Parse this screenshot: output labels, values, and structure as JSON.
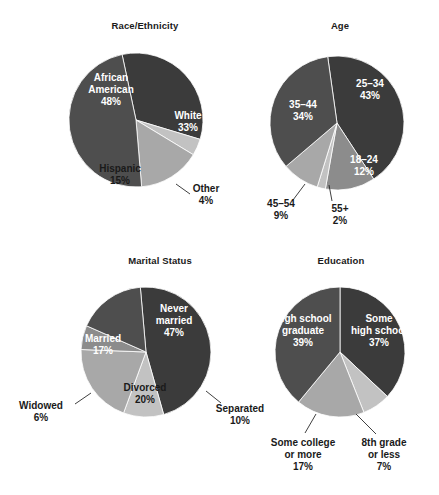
{
  "figure": {
    "background": "#ffffff",
    "width": 439,
    "height": 495
  },
  "palette": {
    "darkest": "#3b3b3b",
    "dark": "#4e4e4e",
    "mid": "#8c8c8c",
    "light": "#a8a8a8",
    "lightest": "#c2c2c2",
    "label_on_dark": "#ffffff",
    "label_on_light": "#1a1a1a",
    "leader_line": "#2a2a2a"
  },
  "charts": [
    {
      "id": "race-ethnicity",
      "title": "Race/Ethnicity",
      "title_pos": {
        "x": 145,
        "y": 29
      },
      "center": {
        "x": 136,
        "y": 120
      },
      "radius": 67,
      "start_angle": -12,
      "slices": [
        {
          "name": "White",
          "value": 33,
          "label": "White",
          "pct": "33%",
          "color": "#3b3b3b",
          "placement": "inside",
          "label_pos": {
            "x": 188,
            "y": 119
          },
          "text_fill": "#ffffff"
        },
        {
          "name": "Other",
          "value": 4,
          "label": "Other",
          "pct": "4%",
          "color": "#c2c2c2",
          "placement": "outside",
          "label_pos": {
            "x": 206,
            "y": 192
          },
          "text_fill": "#1a1a1a",
          "leader": [
            [
              176,
              184
            ],
            [
              190,
              194
            ]
          ]
        },
        {
          "name": "Hispanic",
          "value": 15,
          "label": "Hispanic",
          "pct": "15%",
          "color": "#a8a8a8",
          "placement": "inside",
          "label_pos": {
            "x": 120,
            "y": 172
          },
          "text_fill": "#1a1a1a"
        },
        {
          "name": "African American",
          "value": 48,
          "label": "African American",
          "pct": "48%",
          "color": "#4e4e4e",
          "placement": "inside",
          "label_pos": {
            "x": 111,
            "y": 81
          },
          "text_fill": "#ffffff"
        }
      ]
    },
    {
      "id": "age",
      "title": "Age",
      "title_pos": {
        "x": 340,
        "y": 29
      },
      "center": {
        "x": 337,
        "y": 123
      },
      "radius": 67,
      "start_angle": -8,
      "slices": [
        {
          "name": "25-34",
          "value": 43,
          "label": "25–34",
          "pct": "43%",
          "color": "#3b3b3b",
          "placement": "inside",
          "label_pos": {
            "x": 370,
            "y": 87
          },
          "text_fill": "#ffffff"
        },
        {
          "name": "18-24",
          "value": 12,
          "label": "18–24",
          "pct": "12%",
          "color": "#8c8c8c",
          "placement": "inside",
          "label_pos": {
            "x": 364,
            "y": 163
          },
          "text_fill": "#ffffff"
        },
        {
          "name": "55+",
          "value": 2,
          "label": "55+",
          "pct": "2%",
          "color": "#c2c2c2",
          "placement": "outside",
          "label_pos": {
            "x": 340,
            "y": 212
          },
          "text_fill": "#1a1a1a",
          "leader": [
            [
              329,
              185
            ],
            [
              332,
              201
            ]
          ]
        },
        {
          "name": "45-54",
          "value": 9,
          "label": "45–54",
          "pct": "9%",
          "color": "#a8a8a8",
          "placement": "outside",
          "label_pos": {
            "x": 281,
            "y": 207
          },
          "text_fill": "#1a1a1a",
          "leader": [
            [
              305,
              184
            ],
            [
              293,
              200
            ]
          ]
        },
        {
          "name": "35-44",
          "value": 34,
          "label": "35–44",
          "pct": "34%",
          "color": "#4e4e4e",
          "placement": "inside",
          "label_pos": {
            "x": 303,
            "y": 108
          },
          "text_fill": "#ffffff"
        }
      ]
    },
    {
      "id": "marital-status",
      "title": "Marital Status",
      "title_pos": {
        "x": 160,
        "y": 264
      },
      "center": {
        "x": 146,
        "y": 352
      },
      "radius": 65,
      "start_angle": -5,
      "slices": [
        {
          "name": "Never married",
          "value": 47,
          "label": "Never married",
          "pct": "47%",
          "color": "#3b3b3b",
          "placement": "inside",
          "label_pos": {
            "x": 174,
            "y": 312
          },
          "text_fill": "#ffffff"
        },
        {
          "name": "Separated",
          "value": 10,
          "label": "Separated",
          "pct": "10%",
          "color": "#c2c2c2",
          "placement": "outside",
          "label_pos": {
            "x": 240,
            "y": 412
          },
          "text_fill": "#1a1a1a",
          "leader": [
            [
              206,
              391
            ],
            [
              221,
              403
            ]
          ]
        },
        {
          "name": "Divorced",
          "value": 20,
          "label": "Divorced",
          "pct": "20%",
          "color": "#a8a8a8",
          "placement": "inside",
          "label_pos": {
            "x": 145,
            "y": 391
          },
          "text_fill": "#1a1a1a"
        },
        {
          "name": "Widowed",
          "value": 6,
          "label": "Widowed",
          "pct": "6%",
          "color": "#8c8c8c",
          "placement": "outside",
          "label_pos": {
            "x": 41,
            "y": 409
          },
          "text_fill": "#1a1a1a",
          "leader": [
            [
              91,
              393
            ],
            [
              75,
              404
            ]
          ]
        },
        {
          "name": "Married",
          "value": 17,
          "label": "Married",
          "pct": "17%",
          "color": "#4e4e4e",
          "placement": "inside",
          "label_pos": {
            "x": 103,
            "y": 342
          },
          "text_fill": "#ffffff"
        }
      ]
    },
    {
      "id": "education",
      "title": "Education",
      "title_pos": {
        "x": 341,
        "y": 264
      },
      "center": {
        "x": 340,
        "y": 352
      },
      "radius": 65,
      "start_angle": 0,
      "slices": [
        {
          "name": "Some high school",
          "value": 37,
          "label": "Some high school",
          "pct": "37%",
          "color": "#3b3b3b",
          "placement": "inside",
          "label_pos": {
            "x": 379,
            "y": 322
          },
          "text_fill": "#ffffff"
        },
        {
          "name": "8th grade or less",
          "value": 7,
          "label": "8th grade or less",
          "pct": "7%",
          "color": "#c2c2c2",
          "placement": "outside",
          "label_pos": {
            "x": 384,
            "y": 446
          },
          "text_fill": "#1a1a1a",
          "leader": [
            [
              356,
              414
            ],
            [
              376,
              434
            ]
          ]
        },
        {
          "name": "Some college or more",
          "value": 17,
          "label": "Some college or more",
          "pct": "17%",
          "color": "#a8a8a8",
          "placement": "outside",
          "label_pos": {
            "x": 303,
            "y": 446
          },
          "text_fill": "#1a1a1a",
          "leader": [
            [
              316,
              414
            ],
            [
              305,
              433
            ]
          ]
        },
        {
          "name": "High school graduate",
          "value": 39,
          "label": "High school graduate",
          "pct": "39%",
          "color": "#4e4e4e",
          "placement": "inside",
          "label_pos": {
            "x": 303,
            "y": 322
          },
          "text_fill": "#ffffff"
        }
      ]
    }
  ],
  "chart_data": [
    {
      "type": "pie",
      "title": "Race/Ethnicity",
      "categories": [
        "White",
        "Other",
        "Hispanic",
        "African American"
      ],
      "values": [
        33,
        4,
        15,
        48
      ],
      "unit": "percent",
      "labels": [
        "White 33%",
        "Other 4%",
        "Hispanic 15%",
        "African American 48%"
      ],
      "legend": "none",
      "xlabel": "",
      "ylabel": ""
    },
    {
      "type": "pie",
      "title": "Age",
      "categories": [
        "25–34",
        "18–24",
        "55+",
        "45–54",
        "35–44"
      ],
      "values": [
        43,
        12,
        2,
        9,
        34
      ],
      "unit": "percent",
      "labels": [
        "25–34 43%",
        "18–24 12%",
        "55+ 2%",
        "45–54 9%",
        "35–44 34%"
      ],
      "legend": "none",
      "xlabel": "",
      "ylabel": ""
    },
    {
      "type": "pie",
      "title": "Marital Status",
      "categories": [
        "Never married",
        "Separated",
        "Divorced",
        "Widowed",
        "Married"
      ],
      "values": [
        47,
        10,
        20,
        6,
        17
      ],
      "unit": "percent",
      "labels": [
        "Never married 47%",
        "Separated 10%",
        "Divorced 20%",
        "Widowed 6%",
        "Married 17%"
      ],
      "legend": "none",
      "xlabel": "",
      "ylabel": ""
    },
    {
      "type": "pie",
      "title": "Education",
      "categories": [
        "Some high school",
        "8th grade or less",
        "Some college or more",
        "High school graduate"
      ],
      "values": [
        37,
        7,
        17,
        39
      ],
      "unit": "percent",
      "labels": [
        "Some high school 37%",
        "8th grade or less 7%",
        "Some college or more 17%",
        "High school graduate 39%"
      ],
      "legend": "none",
      "xlabel": "",
      "ylabel": ""
    }
  ]
}
